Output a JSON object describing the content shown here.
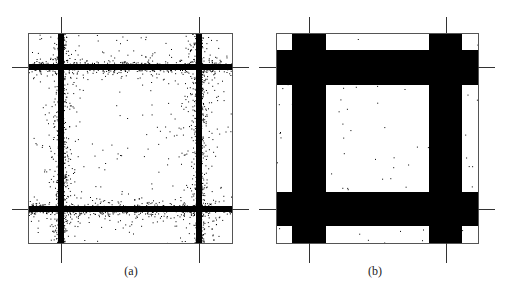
{
  "figure": {
    "panels": [
      {
        "id": "a",
        "caption": "(a)",
        "style": "scatter",
        "box": {
          "x1": 28,
          "y1": 33,
          "x2": 232,
          "y2": 243
        },
        "vlines": [
          61,
          199
        ],
        "hlines": [
          67,
          209
        ],
        "tick_extent": {
          "top": 17,
          "bottom": 263,
          "left": 12,
          "right": 249
        },
        "band_halfwidth": 3,
        "spread": 10,
        "dense_dots": 2600,
        "sparse_dots": 180,
        "caption_pos": {
          "x": 111,
          "y": 264
        }
      },
      {
        "id": "b",
        "caption": "(b)",
        "style": "filled",
        "box": {
          "x1": 276,
          "y1": 33,
          "x2": 478,
          "y2": 243
        },
        "vlines": [
          309,
          446
        ],
        "hlines": [
          67,
          209
        ],
        "tick_extent": {
          "top": 17,
          "bottom": 263,
          "left": 259,
          "right": 495
        },
        "bands": {
          "v": [
            [
              292,
              326
            ],
            [
              429,
              462
            ]
          ],
          "h": [
            [
              50,
              85
            ],
            [
              192,
              226
            ]
          ]
        },
        "sparse_dots": 110,
        "caption_pos": {
          "x": 355,
          "y": 264
        }
      }
    ],
    "colors": {
      "ink": "#000000",
      "frame": "#555555",
      "tick": "#333333",
      "background": "#ffffff"
    }
  }
}
